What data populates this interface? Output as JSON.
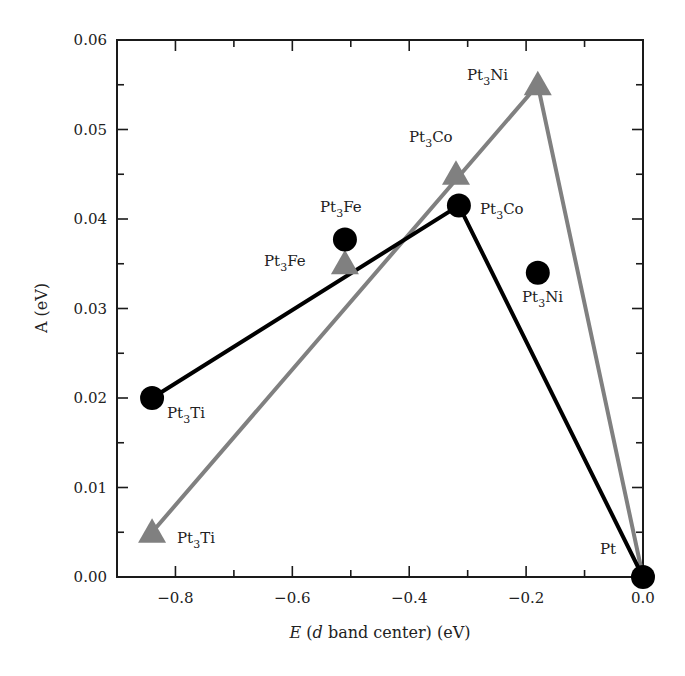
{
  "chart_data": {
    "type": "scatter",
    "title": "",
    "xlabel": "E (d band center) (eV)",
    "xlabel_parts": {
      "italic_E": "E",
      "open": " (",
      "italic_d": "d",
      "rest": " band center) (eV)"
    },
    "ylabel": "A (eV)",
    "xlim": [
      -0.9,
      0.0
    ],
    "ylim": [
      0.0,
      0.06
    ],
    "grid": false,
    "legend": null,
    "x_ticks": [
      -0.8,
      -0.6,
      -0.4,
      -0.2,
      0.0
    ],
    "x_tick_labels": [
      "−0.8",
      "−0.6",
      "−0.4",
      "−0.2",
      "0.0"
    ],
    "x_minor_ticks": [
      -0.7,
      -0.5,
      -0.3,
      -0.1
    ],
    "y_ticks": [
      0.0,
      0.01,
      0.02,
      0.03,
      0.04,
      0.05,
      0.06
    ],
    "y_tick_labels": [
      "0.00",
      "0.01",
      "0.02",
      "0.03",
      "0.04",
      "0.05",
      "0.06"
    ],
    "y_minor_ticks": [
      0.005,
      0.015,
      0.025,
      0.035,
      0.045,
      0.055
    ],
    "series": [
      {
        "name": "circles",
        "marker": "circle",
        "color": "#000000",
        "points": [
          {
            "label": "Pt",
            "sub": "",
            "x": 0.0,
            "y": 0.0
          },
          {
            "label": "Pt3Co",
            "x": -0.315,
            "y": 0.0415
          },
          {
            "label": "Pt3Ti",
            "x": -0.84,
            "y": 0.02
          },
          {
            "label": "Pt3Fe",
            "x": -0.51,
            "y": 0.0377
          },
          {
            "label": "Pt3Ni",
            "x": -0.18,
            "y": 0.034
          }
        ],
        "connecting_line": {
          "color": "#000000",
          "order": [
            "Pt3Ti",
            "Pt3Co",
            "Pt"
          ]
        }
      },
      {
        "name": "triangles",
        "marker": "triangle",
        "color": "#808080",
        "points": [
          {
            "label": "Pt",
            "x": 0.0,
            "y": 0.0
          },
          {
            "label": "Pt3Ni",
            "x": -0.18,
            "y": 0.055
          },
          {
            "label": "Pt3Co",
            "x": -0.32,
            "y": 0.045
          },
          {
            "label": "Pt3Fe",
            "x": -0.51,
            "y": 0.035
          },
          {
            "label": "Pt3Ti",
            "x": -0.84,
            "y": 0.005
          }
        ],
        "connecting_line": {
          "color": "#808080",
          "order": [
            "Pt3Ti",
            "Pt3Ni",
            "Pt"
          ]
        }
      }
    ],
    "annotations": [
      {
        "text": "Pt",
        "base": "Pt",
        "sub": "",
        "elem": "",
        "near": "Pt (0.0, 0.00)"
      },
      {
        "text": "Pt3Ni",
        "base": "Pt",
        "sub": "3",
        "elem": "Ni",
        "near": "triangle (-0.18, 0.055)"
      },
      {
        "text": "Pt3Co",
        "base": "Pt",
        "sub": "3",
        "elem": "Co",
        "near": "triangle (-0.32, 0.045)"
      },
      {
        "text": "Pt3Co",
        "base": "Pt",
        "sub": "3",
        "elem": "Co",
        "near": "circle (-0.315, 0.0415)"
      },
      {
        "text": "Pt3Fe",
        "base": "Pt",
        "sub": "3",
        "elem": "Fe",
        "near": "circle (-0.51, 0.0377)"
      },
      {
        "text": "Pt3Fe",
        "base": "Pt",
        "sub": "3",
        "elem": "Fe",
        "near": "triangle (-0.51, 0.035)"
      },
      {
        "text": "Pt3Ni",
        "base": "Pt",
        "sub": "3",
        "elem": "Ni",
        "near": "circle (-0.18, 0.034)"
      },
      {
        "text": "Pt3Ti",
        "base": "Pt",
        "sub": "3",
        "elem": "Ti",
        "near": "circle (-0.84, 0.020)"
      },
      {
        "text": "Pt3Ti",
        "base": "Pt",
        "sub": "3",
        "elem": "Ti",
        "near": "triangle (-0.84, 0.005)"
      }
    ]
  },
  "colors": {
    "axis": "#1a1a1a",
    "black_series": "#000000",
    "gray_series": "#808080"
  }
}
